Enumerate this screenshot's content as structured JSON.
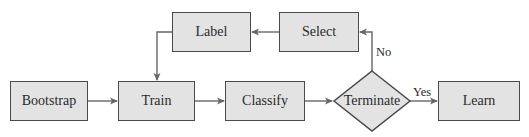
{
  "diagram": {
    "type": "flowchart",
    "colors": {
      "node_fill": "#e3e3e3",
      "node_border": "#4a4a4a",
      "edge": "#666666",
      "text": "#2a2a2a"
    },
    "nodes": {
      "bootstrap": {
        "label": "Bootstrap",
        "shape": "rectangle"
      },
      "train": {
        "label": "Train",
        "shape": "rectangle"
      },
      "classify": {
        "label": "Classify",
        "shape": "rectangle"
      },
      "terminate": {
        "label": "Terminate",
        "shape": "diamond"
      },
      "learn": {
        "label": "Learn",
        "shape": "rectangle"
      },
      "select": {
        "label": "Select",
        "shape": "rectangle"
      },
      "label": {
        "label": "Label",
        "shape": "rectangle"
      }
    },
    "edges": [
      {
        "from": "bootstrap",
        "to": "train",
        "label": ""
      },
      {
        "from": "train",
        "to": "classify",
        "label": ""
      },
      {
        "from": "classify",
        "to": "terminate",
        "label": ""
      },
      {
        "from": "terminate",
        "to": "learn",
        "label": "Yes"
      },
      {
        "from": "terminate",
        "to": "select",
        "label": "No"
      },
      {
        "from": "select",
        "to": "label",
        "label": ""
      },
      {
        "from": "label",
        "to": "train",
        "label": ""
      }
    ],
    "edge_labels": {
      "yes": "Yes",
      "no": "No"
    }
  }
}
